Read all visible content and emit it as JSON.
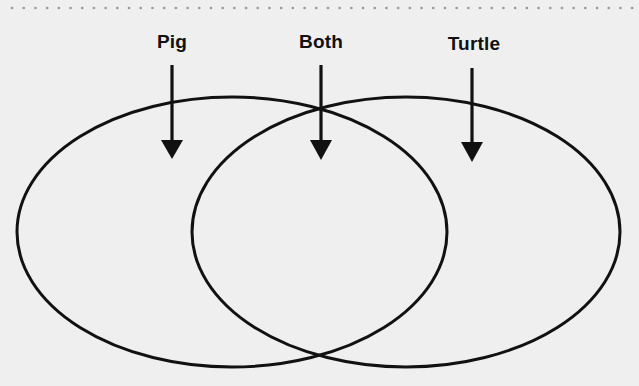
{
  "diagram": {
    "type": "venn",
    "colors": {
      "background": "#efefef",
      "stroke": "#111111",
      "dots": "#9a9a9a"
    },
    "labels": [
      {
        "key": "pig",
        "text": "Pig",
        "x": 172
      },
      {
        "key": "both",
        "text": "Both",
        "x": 321
      },
      {
        "key": "turtle",
        "text": "Turtle",
        "x": 472
      }
    ],
    "circles": [
      {
        "name": "pig",
        "cx": 232,
        "cy": 232,
        "rx": 215,
        "ry": 135
      },
      {
        "name": "turtle",
        "cx": 406,
        "cy": 232,
        "rx": 214,
        "ry": 135
      }
    ]
  }
}
